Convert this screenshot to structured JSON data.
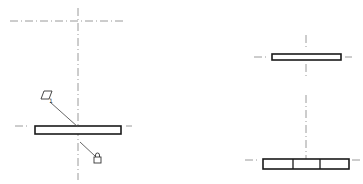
{
  "drawing": {
    "type": "engineering-drawing",
    "views": [
      {
        "name": "left-view",
        "components": [
          "horizontal-plate",
          "flatness-symbol",
          "datum-symbol"
        ]
      },
      {
        "name": "right-top-view",
        "components": [
          "thin-plate"
        ]
      },
      {
        "name": "right-bottom-view",
        "components": [
          "segmented-plate"
        ]
      }
    ],
    "annotations": {
      "flatness_symbol": "▱",
      "flatness_subscript": "1",
      "datum_symbol": "lock"
    },
    "colors": {
      "outline": "#1a1a1a",
      "centerline": "#9a9a9a",
      "leader": "#555555"
    }
  }
}
